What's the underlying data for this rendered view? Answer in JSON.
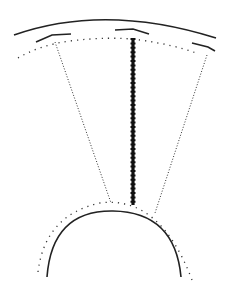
{
  "diagram": {
    "type": "radial-sector-schematic",
    "background": "#ffffff",
    "stroke_color": "#222222",
    "outer_arc": {
      "style": "solid"
    },
    "outer_segments": {
      "count": 3,
      "style": "solid-short"
    },
    "outer_dotted_arc": {
      "style": "dotted"
    },
    "left_radial_line": {
      "style": "dotted"
    },
    "right_radial_line": {
      "style": "dotted"
    },
    "center_line": {
      "style": "thick-beaded"
    },
    "inner_dotted_arc": {
      "style": "dotted"
    },
    "inner_arc": {
      "style": "solid"
    }
  }
}
